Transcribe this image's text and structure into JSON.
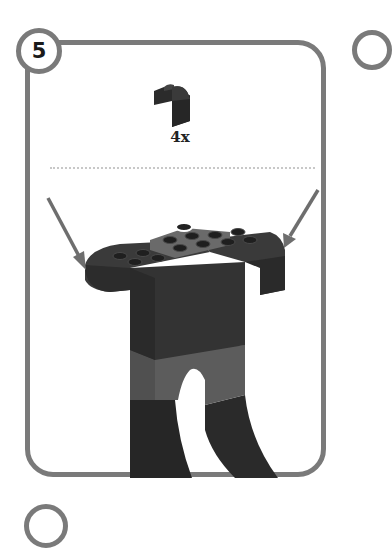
{
  "step": {
    "number": "5",
    "parts_needed": [
      {
        "piece": "curved-slope-brick",
        "color": "#2e2e2e",
        "quantity": "4x"
      }
    ]
  },
  "colors": {
    "border": "#7a7a7a",
    "brick_dark": "#2e2e2e",
    "brick_mid": "#585858",
    "arrow": "#6e6e6e"
  },
  "annotations": {
    "arrows": [
      {
        "side": "left",
        "target": "left-shoulder"
      },
      {
        "side": "right",
        "target": "right-shoulder"
      }
    ]
  }
}
